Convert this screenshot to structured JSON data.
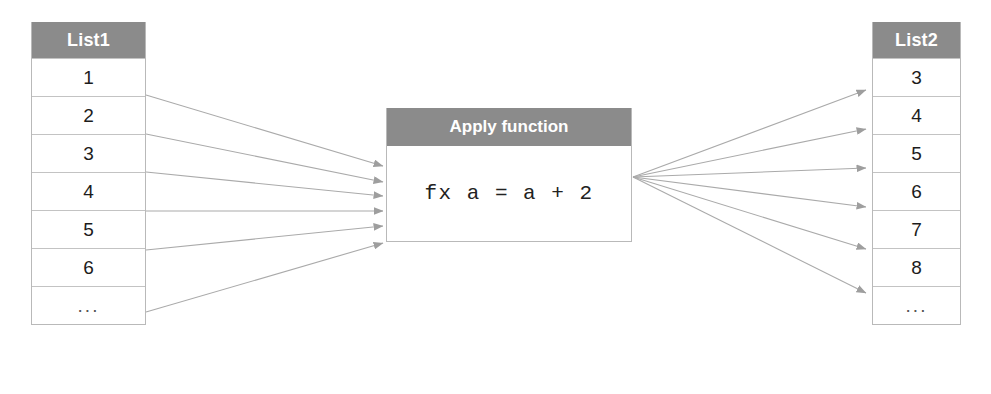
{
  "diagram": {
    "stroke_color": "#a8a8a8",
    "header_color": "#8b8b8b",
    "border_color": "#b9b9b9"
  },
  "source_list": {
    "name": "list1",
    "header": "List1",
    "rows": [
      "1",
      "2",
      "3",
      "4",
      "5",
      "6",
      "..."
    ]
  },
  "function_box": {
    "header": "Apply function",
    "expression": "fx a = a + 2"
  },
  "target_list": {
    "name": "list2",
    "header": "List2",
    "rows": [
      "3",
      "4",
      "5",
      "6",
      "7",
      "8",
      "..."
    ]
  },
  "connections": {
    "input_arrow_count": 6,
    "output_arrow_count": 6,
    "input_origin_x": 146,
    "input_origin_ys": [
      95,
      134,
      172,
      211,
      250,
      312
    ],
    "input_target_x": 383,
    "input_target_ys": [
      166,
      182,
      196,
      211,
      226,
      243
    ],
    "output_origin_x": 633,
    "output_origin_y": 177,
    "output_target_x": 866,
    "output_target_ys": [
      90,
      129,
      168,
      207,
      249,
      293
    ]
  }
}
